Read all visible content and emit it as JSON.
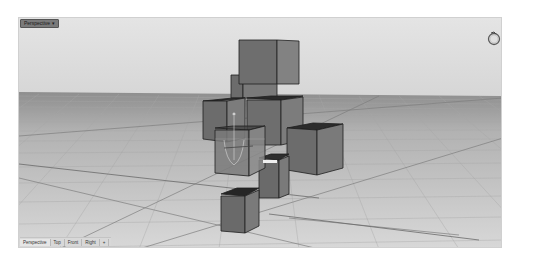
{
  "viewport": {
    "title": "Perspective ▾",
    "navigation_widget_icon": "rotate-ring-icon",
    "colors": {
      "sky": "#dedede",
      "floor": "#c8c8c8",
      "grid_minor": "#b8b8b8",
      "grid_major": "#8a8a8a",
      "cube_face_front": "#6e6e6e",
      "cube_face_side": "#7c7c7c",
      "cube_face_top": "#2e2e2e",
      "cube_edge": "#1e1e1e"
    }
  },
  "bottom_tabs": [
    {
      "label": "Perspective",
      "active": true
    },
    {
      "label": "Top",
      "active": false
    },
    {
      "label": "Front",
      "active": false
    },
    {
      "label": "Right",
      "active": false
    },
    {
      "label": "+",
      "active": false
    }
  ]
}
